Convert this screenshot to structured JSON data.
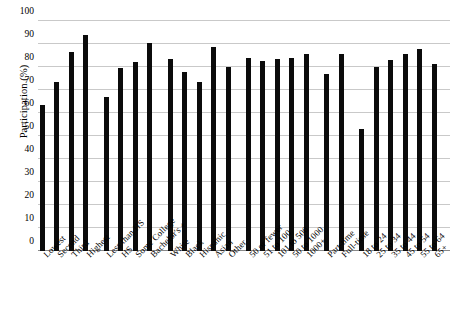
{
  "chart_data": {
    "type": "bar",
    "title": "",
    "xlabel": "",
    "ylabel": "Participation (%)",
    "ylim": [
      0,
      100
    ],
    "yticks": [
      0,
      10,
      20,
      30,
      40,
      50,
      60,
      70,
      80,
      90,
      100
    ],
    "grid": true,
    "legend": "none",
    "bar_color": "#0b0b0b",
    "categories": [
      "Lowest",
      "Second",
      "Third",
      "Highest",
      "Less than HS",
      "HS",
      "Some College",
      "Bachelor's +",
      "White",
      "Black",
      "Hispanic",
      "Asian",
      "Other",
      "50 or fewer",
      "51 to 100",
      "101 to 500",
      "50 to 1000",
      "1000+",
      "Part-time",
      "Full-time",
      "18 to 24",
      "25 to 34",
      "35 to 44",
      "45 to 54",
      "55 to 64",
      "65+"
    ],
    "values": [
      63.5,
      73.5,
      86.5,
      94,
      67,
      79.5,
      82,
      90.5,
      83.5,
      78,
      73.5,
      88.5,
      80,
      84,
      82.5,
      83.5,
      84,
      85.5,
      77,
      85.5,
      53,
      80,
      83,
      85.5,
      88,
      81.5
    ],
    "groups": [
      {
        "name": "Income quartile",
        "start": 0,
        "count": 4
      },
      {
        "name": "Education",
        "start": 4,
        "count": 4
      },
      {
        "name": "Race and ethnicity",
        "start": 8,
        "count": 5
      },
      {
        "name": "Firm size",
        "start": 13,
        "count": 5
      },
      {
        "name": "Work status",
        "start": 18,
        "count": 2
      },
      {
        "name": "Age",
        "start": 20,
        "count": 6
      }
    ]
  }
}
